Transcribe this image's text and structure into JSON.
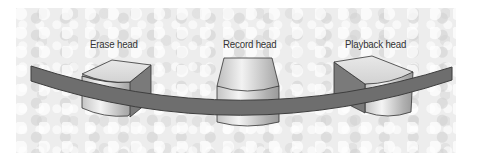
{
  "diagram": {
    "labels": {
      "erase": "Erase head",
      "record": "Record head",
      "playback": "Playback head"
    },
    "colors": {
      "background": "#ededed",
      "tape": "#6e6e6e",
      "tape_edge": "#3e3e3e",
      "head_top": "#e4e4e4",
      "head_side_dark": "#7a7a7a",
      "head_cylinder": "#d8d8d8"
    }
  }
}
